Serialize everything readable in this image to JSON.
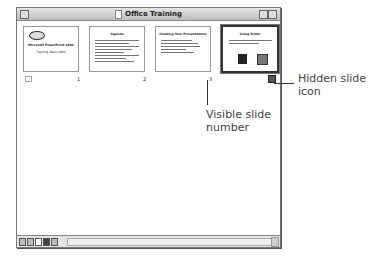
{
  "window": {
    "title": "Office Training"
  },
  "slides": [
    {
      "number": "1",
      "title": "Microsoft PowerPoint 2001",
      "subtitle": "Training Team 2001"
    },
    {
      "number": "2",
      "title": "Agenda"
    },
    {
      "number": "3",
      "title": "Creating Your Presentations"
    },
    {
      "number": "",
      "title": "Using Slides",
      "hidden": true,
      "selected": true
    }
  ],
  "view_buttons": [
    "normal-view",
    "outline-view",
    "slide-view",
    "slide-sorter-view",
    "slide-show"
  ],
  "annotations": {
    "hidden_slide_icon": "Hidden slide icon",
    "visible_slide_number": "Visible slide number"
  }
}
